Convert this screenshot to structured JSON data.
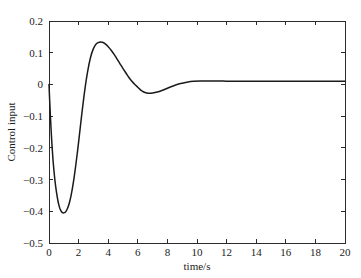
{
  "chart_data": {
    "type": "line",
    "title": "",
    "xlabel": "time/s",
    "ylabel": "Control input",
    "xlim": [
      0,
      20
    ],
    "ylim": [
      -0.5,
      0.2
    ],
    "grid": false,
    "legend": null,
    "xticks": [
      0,
      2,
      4,
      6,
      8,
      10,
      12,
      14,
      16,
      18,
      20
    ],
    "xtick_labels": [
      "0",
      "2",
      "4",
      "6",
      "8",
      "10",
      "12",
      "14",
      "16",
      "18",
      "20"
    ],
    "yticks": [
      -0.5,
      -0.4,
      -0.3,
      -0.2,
      -0.1,
      0,
      0.1,
      0.2
    ],
    "ytick_labels": [
      "−0.5",
      "−0.4",
      "−0.3",
      "−0.2",
      "−0.1",
      "0",
      "0.1",
      "0.2"
    ],
    "line_color": "#1a1a1a",
    "series": [
      {
        "name": "control input",
        "x": [
          0.0,
          0.05,
          0.1,
          0.15,
          0.2,
          0.25,
          0.3,
          0.4,
          0.5,
          0.6,
          0.7,
          0.8,
          0.9,
          1.0,
          1.1,
          1.2,
          1.3,
          1.4,
          1.5,
          1.6,
          1.7,
          1.8,
          1.9,
          2.0,
          2.2,
          2.4,
          2.6,
          2.8,
          3.0,
          3.2,
          3.4,
          3.6,
          3.8,
          4.0,
          4.2,
          4.4,
          4.6,
          4.8,
          5.0,
          5.2,
          5.4,
          5.6,
          5.8,
          6.0,
          6.2,
          6.4,
          6.6,
          6.8,
          7.0,
          7.4,
          7.8,
          8.2,
          8.6,
          9.0,
          9.4,
          9.8,
          10.2,
          10.6,
          11.0,
          11.5,
          12.0,
          12.5,
          13.0,
          14.0,
          15.0,
          16.0,
          17.0,
          18.0,
          19.0,
          20.0
        ],
        "y": [
          0.0,
          -0.055,
          -0.105,
          -0.15,
          -0.19,
          -0.224,
          -0.254,
          -0.302,
          -0.338,
          -0.366,
          -0.386,
          -0.398,
          -0.404,
          -0.405,
          -0.403,
          -0.396,
          -0.385,
          -0.369,
          -0.348,
          -0.322,
          -0.292,
          -0.258,
          -0.221,
          -0.182,
          -0.1,
          -0.024,
          0.038,
          0.084,
          0.113,
          0.128,
          0.133,
          0.133,
          0.128,
          0.119,
          0.108,
          0.095,
          0.08,
          0.065,
          0.05,
          0.036,
          0.022,
          0.01,
          0.0,
          -0.009,
          -0.018,
          -0.024,
          -0.027,
          -0.028,
          -0.027,
          -0.023,
          -0.016,
          -0.008,
          -0.001,
          0.004,
          0.008,
          0.01,
          0.011,
          0.011,
          0.011,
          0.011,
          0.01,
          0.01,
          0.01,
          0.01,
          0.01,
          0.01,
          0.01,
          0.01,
          0.01,
          0.01
        ]
      }
    ],
    "annotations": {
      "initial_value": "0",
      "min_value": "-0.405",
      "min_time": "1.0",
      "peak_value": "0.133",
      "peak_time": "3.5",
      "undershoot_value": "-0.028",
      "undershoot_time": "6.8",
      "steady_state": "0.01"
    }
  }
}
